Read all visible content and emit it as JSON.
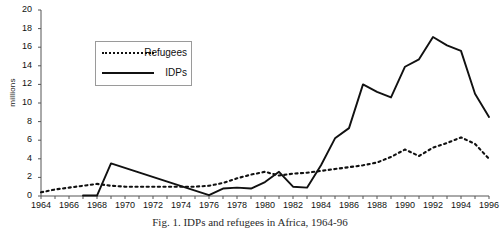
{
  "chart_data": {
    "type": "line",
    "title": "",
    "caption": "Fig. 1. IDPs and refugees in Africa, 1964-96",
    "xlabel": "",
    "ylabel": "millions",
    "xlim": [
      1964,
      1996
    ],
    "ylim": [
      0,
      20
    ],
    "ytick_step": 2,
    "yticks": [
      0,
      2,
      4,
      6,
      8,
      10,
      12,
      14,
      16,
      18,
      20
    ],
    "xticks": [
      1964,
      1966,
      1968,
      1970,
      1972,
      1974,
      1976,
      1978,
      1980,
      1982,
      1984,
      1986,
      1988,
      1990,
      1992,
      1994,
      1996
    ],
    "grid": false,
    "legend_position": "upper-left-inside",
    "series": [
      {
        "name": "Refugees",
        "style": "dotted",
        "color": "#111111",
        "x": [
          1964,
          1965,
          1966,
          1967,
          1968,
          1969,
          1970,
          1971,
          1972,
          1973,
          1974,
          1975,
          1976,
          1977,
          1978,
          1979,
          1980,
          1981,
          1982,
          1983,
          1984,
          1985,
          1986,
          1987,
          1988,
          1989,
          1990,
          1991,
          1992,
          1993,
          1994,
          1995,
          1996
        ],
        "y": [
          0.4,
          0.7,
          0.9,
          1.1,
          1.3,
          1.1,
          1.0,
          1.0,
          1.0,
          1.0,
          1.0,
          1.0,
          1.1,
          1.4,
          1.9,
          2.3,
          2.6,
          2.2,
          2.4,
          2.5,
          2.7,
          2.9,
          3.1,
          3.3,
          3.6,
          4.2,
          5.0,
          4.3,
          5.2,
          5.7,
          6.3,
          5.6,
          4.0
        ]
      },
      {
        "name": "IDPs",
        "style": "solid",
        "color": "#111111",
        "x": [
          1967,
          1968,
          1969,
          1976,
          1977,
          1978,
          1979,
          1980,
          1981,
          1982,
          1983,
          1984,
          1985,
          1986,
          1987,
          1988,
          1989,
          1990,
          1991,
          1992,
          1993,
          1994,
          1995,
          1996
        ],
        "y": [
          0.05,
          0.05,
          3.5,
          0.1,
          0.8,
          0.9,
          0.8,
          1.5,
          2.6,
          1.0,
          0.9,
          3.3,
          6.2,
          7.3,
          12.0,
          11.2,
          10.6,
          13.9,
          14.7,
          17.1,
          16.2,
          15.6,
          11.0,
          8.5
        ]
      }
    ],
    "legend": [
      {
        "label": "Refugees",
        "style": "dotted"
      },
      {
        "label": "IDPs",
        "style": "solid"
      }
    ]
  },
  "axes": {
    "y_title": "millions"
  }
}
